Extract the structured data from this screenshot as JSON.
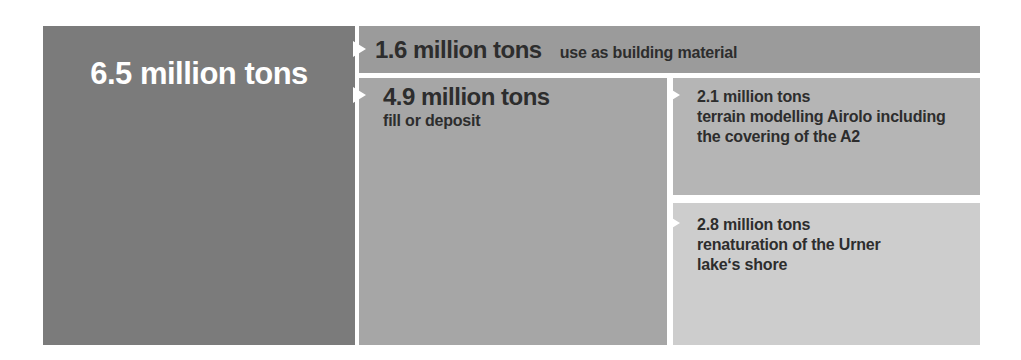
{
  "diagram": {
    "total": {
      "value": "6.5 million tons"
    },
    "building_material": {
      "value": "1.6 million tons",
      "label": "use as building material"
    },
    "fill_or_deposit": {
      "value": "4.9 million tons",
      "label": "fill or deposit"
    },
    "terrain_modelling": {
      "value": "2.1 million tons",
      "lines": [
        "terrain modelling Airolo including",
        "the covering of the A2"
      ]
    },
    "renaturation": {
      "value": "2.8 million tons",
      "lines": [
        "renaturation of the Urner",
        "lake‘s shore"
      ]
    }
  },
  "icons": {
    "arrow": "white right-pointing triangle"
  },
  "colors": {
    "background": "#ffffff",
    "total_block": "#7b7b7b",
    "building_bar": "#9b9b9b",
    "fill_block": "#a6a6a6",
    "terrain_block": "#b5b5b5",
    "renaturation_block": "#cdcdcd",
    "text_dark": "#2d2d2d",
    "text_light": "#ffffff"
  }
}
